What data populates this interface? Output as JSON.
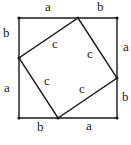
{
  "diagram": {
    "stroke_color": "#1a1a1a",
    "outer_square": {
      "corners": [
        [
          19,
          18
        ],
        [
          117,
          18
        ],
        [
          117,
          118
        ],
        [
          19,
          118
        ]
      ]
    },
    "inner_square": {
      "vertices": [
        [
          78,
          18
        ],
        [
          117,
          78
        ],
        [
          58,
          118
        ],
        [
          19,
          58
        ]
      ]
    },
    "labels": {
      "top_a": "a",
      "top_b": "b",
      "right_a": "a",
      "right_b": "b",
      "bottom_b": "b",
      "bottom_a": "a",
      "left_b": "b",
      "left_a": "a",
      "inner_c_top_left": "c",
      "inner_c_top_right": "c",
      "inner_c_bottom_left": "c",
      "inner_c_bottom_right": "c"
    }
  }
}
